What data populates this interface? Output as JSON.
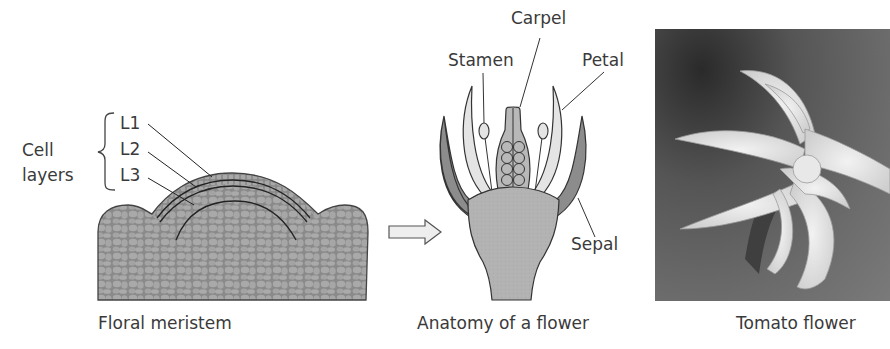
{
  "panels": {
    "meristem": {
      "caption": "Floral meristem",
      "group_label_line1": "Cell",
      "group_label_line2": "layers",
      "layers": [
        "L1",
        "L2",
        "L3"
      ]
    },
    "flower": {
      "caption": "Anatomy of a flower",
      "parts": {
        "carpel": "Carpel",
        "stamen": "Stamen",
        "petal": "Petal",
        "sepal": "Sepal"
      }
    },
    "photo": {
      "caption": "Tomato flower"
    }
  },
  "colors": {
    "meristem_fill": "#8a8a8a",
    "meristem_cells": "#a9a9a9",
    "sepal_fill": "#8c8c8c",
    "petal_fill": "#e4e4e4",
    "receptacle_fill": "#b3b3b3",
    "carpel_fill": "#b8b8b8",
    "arrow_fill": "#eeeeee",
    "outline": "#333333"
  }
}
